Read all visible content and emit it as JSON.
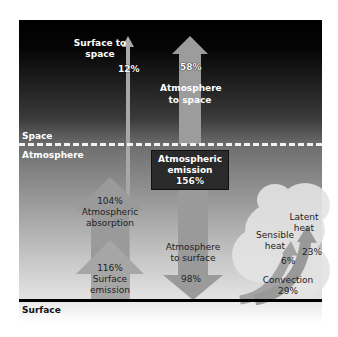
{
  "layers": {
    "space": "Space",
    "atmosphere": "Atmosphere",
    "surface": "Surface"
  },
  "flows": {
    "surface_to_space": {
      "label_line1": "Surface to",
      "label_line2": "space",
      "value": "12%"
    },
    "atmosphere_to_space": {
      "label_line1": "Atmosphere",
      "label_line2": "to space",
      "value": "58%"
    },
    "atmospheric_emission": {
      "label_line1": "Atmospheric",
      "label_line2": "emission",
      "value": "156%"
    },
    "atmospheric_absorption": {
      "label_line1": "Atmospheric",
      "label_line2": "absorption",
      "value": "104%"
    },
    "surface_emission": {
      "label_line1": "Surface",
      "label_line2": "emission",
      "value": "116%"
    },
    "atmosphere_to_surface": {
      "label_line1": "Atmosphere",
      "label_line2": "to surface",
      "value": "98%"
    },
    "sensible_heat": {
      "label_line1": "Sensible",
      "label_line2": "heat",
      "value": "6%"
    },
    "latent_heat": {
      "label_line1": "Latent",
      "label_line2": "heat",
      "value": "23%"
    },
    "convection": {
      "label": "Convection",
      "value": "29%"
    }
  },
  "colors": {
    "arrow_fill": "#9a9a9a",
    "arrow_fill_light": "#b4b4b4",
    "emission_box": "#2a2a2a",
    "cloud": "#e6e6e6"
  }
}
